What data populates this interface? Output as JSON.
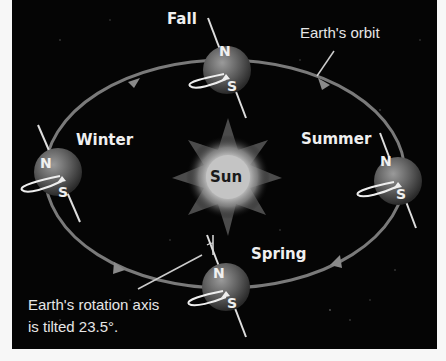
{
  "diagram": {
    "colors": {
      "background": "#050505",
      "orbit": "#7a7a7a",
      "text": "#f0f0f0",
      "sun": "#e8e8e8"
    },
    "center": {
      "label": "Sun"
    },
    "orbit_label": "Earth's orbit",
    "seasons": [
      {
        "name": "Fall",
        "north_label": "N",
        "south_label": "S"
      },
      {
        "name": "Winter",
        "north_label": "N",
        "south_label": "S"
      },
      {
        "name": "Summer",
        "north_label": "N",
        "south_label": "S"
      },
      {
        "name": "Spring",
        "north_label": "N",
        "south_label": "S"
      }
    ],
    "axis_note": {
      "line1": "Earth's rotation axis",
      "line2": "is tilted 23.5°."
    }
  }
}
